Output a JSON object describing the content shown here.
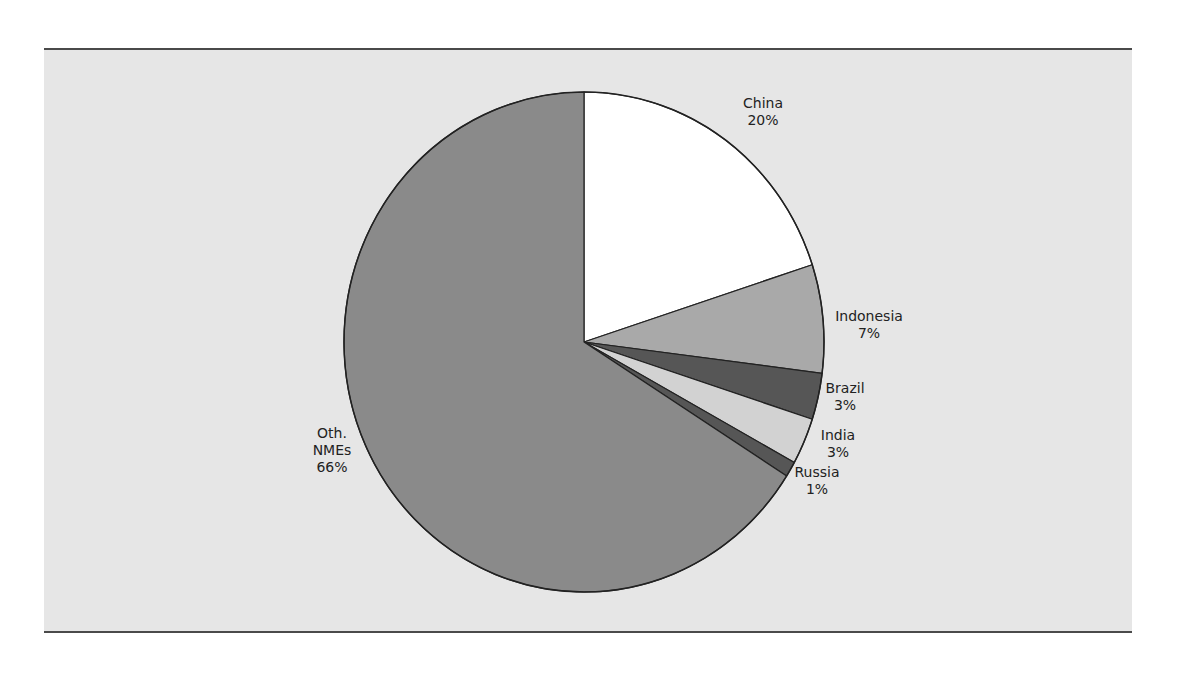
{
  "chart_data": {
    "type": "pie",
    "title": "",
    "start_angle_deg": 0,
    "direction": "clockwise",
    "slices": [
      {
        "label": "China",
        "value": 20,
        "display": "20%",
        "color": "#ffffff",
        "label_pos": [
          763,
          112
        ]
      },
      {
        "label": "Indonesia",
        "value": 7,
        "display": "7%",
        "color": "#a9a9a9",
        "label_pos": [
          869,
          325
        ]
      },
      {
        "label": "Brazil",
        "value": 3,
        "display": "3%",
        "color": "#565656",
        "label_pos": [
          845,
          397
        ]
      },
      {
        "label": "India",
        "value": 3,
        "display": "3%",
        "color": "#d2d2d2",
        "label_pos": [
          838,
          444
        ]
      },
      {
        "label": "Russia",
        "value": 1,
        "display": "1%",
        "color": "#565656",
        "label_pos": [
          817,
          481
        ]
      },
      {
        "label": "Oth. NMEs",
        "value": 66,
        "display": "66%",
        "color": "#8a8a8a",
        "label_pos": [
          332,
          450
        ]
      }
    ],
    "labels": [
      "China",
      "Indonesia",
      "Brazil",
      "India",
      "Russia",
      "Oth. NMEs"
    ],
    "values": [
      20,
      7,
      3,
      3,
      1,
      66
    ],
    "legend": "none (direct labels)",
    "background": "#e6e6e6"
  }
}
